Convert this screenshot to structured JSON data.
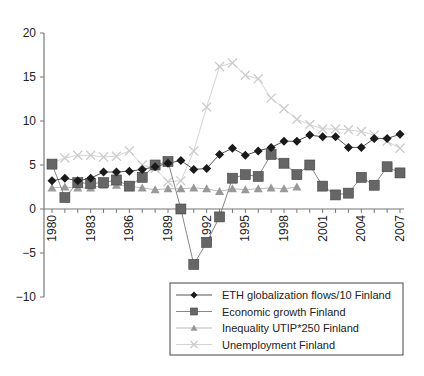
{
  "chart_data": {
    "type": "line",
    "title": "",
    "xlabel": "",
    "ylabel": "",
    "ylim": [
      -10,
      20
    ],
    "yticks": [
      -10,
      -5,
      0,
      5,
      10,
      15,
      20
    ],
    "x": [
      1980,
      1981,
      1982,
      1983,
      1984,
      1985,
      1986,
      1987,
      1988,
      1989,
      1990,
      1991,
      1992,
      1993,
      1994,
      1995,
      1996,
      1997,
      1998,
      1999,
      2000,
      2001,
      2002,
      2003,
      2004,
      2005,
      2006,
      2007
    ],
    "xtick_labels": [
      "1980",
      "1983",
      "1986",
      "1989",
      "1992",
      "1995",
      "1998",
      "2001",
      "2004",
      "2007"
    ],
    "grid": false,
    "legend_position": "lower right",
    "series": [
      {
        "name": "ETH globalization flows/10 Finland",
        "marker": "diamond",
        "color": "#1a1a1a",
        "line_color": "#555555",
        "values": [
          3.2,
          3.5,
          3.2,
          3.5,
          4.2,
          4.2,
          4.3,
          4.5,
          4.8,
          5.2,
          5.5,
          4.5,
          4.6,
          6.2,
          6.9,
          6.1,
          6.6,
          7.0,
          7.7,
          7.7,
          8.4,
          8.2,
          8.2,
          7.0,
          7.0,
          8.0,
          8.0,
          8.5
        ]
      },
      {
        "name": "Economic growth Finland",
        "marker": "square",
        "color": "#666666",
        "line_color": "#888888",
        "values": [
          5.1,
          1.3,
          3.0,
          2.9,
          3.0,
          3.3,
          2.6,
          3.6,
          5.0,
          5.4,
          0.0,
          -6.3,
          -3.8,
          -0.9,
          3.5,
          3.9,
          3.7,
          6.2,
          5.2,
          3.9,
          5.0,
          2.6,
          1.6,
          1.8,
          3.6,
          2.7,
          4.8,
          4.1
        ]
      },
      {
        "name": "Inequality UTIP*250 Finland",
        "marker": "triangle",
        "color": "#999999",
        "line_color": "#bbbbbb",
        "values": [
          2.4,
          2.5,
          2.4,
          2.4,
          2.7,
          2.7,
          2.6,
          2.4,
          2.2,
          2.3,
          2.3,
          2.4,
          2.3,
          2.0,
          2.3,
          2.2,
          2.3,
          2.4,
          2.3,
          2.5,
          null,
          null,
          null,
          null,
          null,
          null,
          null,
          null
        ]
      },
      {
        "name": "Unemployment Finland",
        "marker": "x",
        "color": "#cccccc",
        "line_color": "#d4d4d4",
        "values": [
          5.2,
          5.8,
          6.1,
          6.1,
          5.9,
          6.0,
          6.6,
          5.0,
          4.6,
          3.1,
          3.2,
          6.6,
          11.6,
          16.2,
          16.6,
          15.2,
          14.8,
          12.6,
          11.4,
          10.2,
          9.6,
          9.1,
          9.1,
          9.0,
          8.8,
          8.4,
          7.7,
          6.9
        ]
      }
    ]
  }
}
